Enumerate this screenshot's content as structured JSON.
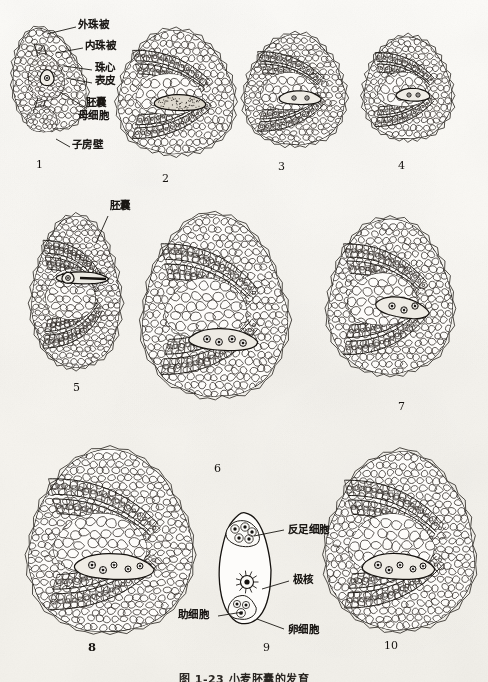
{
  "plate": {
    "title": "小麦胚囊的发育",
    "caption": "图 1-23  小麦胚囊的发育",
    "background_color": "#faf8f4",
    "ink_color": "#1b1814"
  },
  "labels": {
    "outer_integument": "外珠被",
    "inner_integument": "内珠被",
    "nucellus": "珠心",
    "epidermis": "表皮",
    "embryo_sac_mother_cell_line1": "胚囊",
    "embryo_sac_mother_cell_line2": "母细胞",
    "ovary_wall": "子房壁",
    "embryo_sac": "胚囊",
    "antipodal_cells": "反足细胞",
    "polar_nuclei": "极核",
    "synergids": "助细胞",
    "egg_cell": "卵细胞"
  },
  "figures": [
    {
      "number": "1",
      "bold": false,
      "caption_x": 36,
      "caption_y": 158,
      "description": "ovule primordium with embryo sac mother cell"
    },
    {
      "number": "2",
      "bold": false,
      "caption_x": 162,
      "caption_y": 172,
      "description": "megaspore mother cell enlarged in nucellus"
    },
    {
      "number": "3",
      "bold": false,
      "caption_x": 278,
      "caption_y": 160,
      "description": "megaspore stage"
    },
    {
      "number": "4",
      "bold": false,
      "caption_x": 398,
      "caption_y": 159,
      "description": "functional megaspore"
    },
    {
      "number": "5",
      "bold": false,
      "caption_x": 73,
      "caption_y": 381,
      "description": "two-nucleate embryo sac"
    },
    {
      "number": "6",
      "bold": false,
      "caption_x": 214,
      "caption_y": 462,
      "description": "four-nucleate embryo sac"
    },
    {
      "number": "7",
      "bold": false,
      "caption_x": 398,
      "caption_y": 400,
      "description": "eight-nucleate embryo sac"
    },
    {
      "number": "8",
      "bold": true,
      "caption_x": 88,
      "caption_y": 640,
      "description": "mature embryo sac, whole ovule"
    },
    {
      "number": "9",
      "bold": false,
      "caption_x": 263,
      "caption_y": 641,
      "description": "isolated mature embryo sac detail"
    },
    {
      "number": "10",
      "bold": false,
      "caption_x": 384,
      "caption_y": 639,
      "description": "mature embryo sac in ovule"
    }
  ],
  "label_positions": {
    "outer_integument": {
      "x": 78,
      "y": 24
    },
    "inner_integument": {
      "x": 85,
      "y": 45
    },
    "nucellus": {
      "x": 95,
      "y": 67
    },
    "epidermis": {
      "x": 95,
      "y": 80
    },
    "embryo_sac_mother": {
      "x": 82,
      "y": 104
    },
    "ovary_wall": {
      "x": 66,
      "y": 144
    },
    "embryo_sac_fig5": {
      "x": 104,
      "y": 205
    },
    "antipodal_cells": {
      "x": 287,
      "y": 527
    },
    "polar_nuclei": {
      "x": 292,
      "y": 577
    },
    "synergids": {
      "x": 182,
      "y": 612
    },
    "egg_cell": {
      "x": 287,
      "y": 627
    }
  }
}
